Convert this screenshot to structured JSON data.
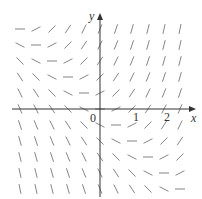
{
  "diagram": {
    "type": "slope-field",
    "equation_form": "dy/dx = x + y",
    "axes": {
      "x_label": "x",
      "y_label": "y",
      "origin_label": "0",
      "x_ticks": [
        "1",
        "2"
      ],
      "x_range": [
        -3,
        3
      ],
      "y_range": [
        -3,
        3
      ]
    },
    "grid": {
      "x_values": [
        -2.5,
        -2,
        -1.5,
        -1,
        -0.5,
        0,
        0.5,
        1,
        1.5,
        2,
        2.5
      ],
      "y_values": [
        2.5,
        2,
        1.5,
        1,
        0.5,
        0,
        -0.5,
        -1,
        -1.5,
        -2,
        -2.5
      ],
      "step": 0.5
    },
    "colors": {
      "segment": "#777777",
      "axis": "#333333",
      "background": "#ffffff"
    }
  }
}
